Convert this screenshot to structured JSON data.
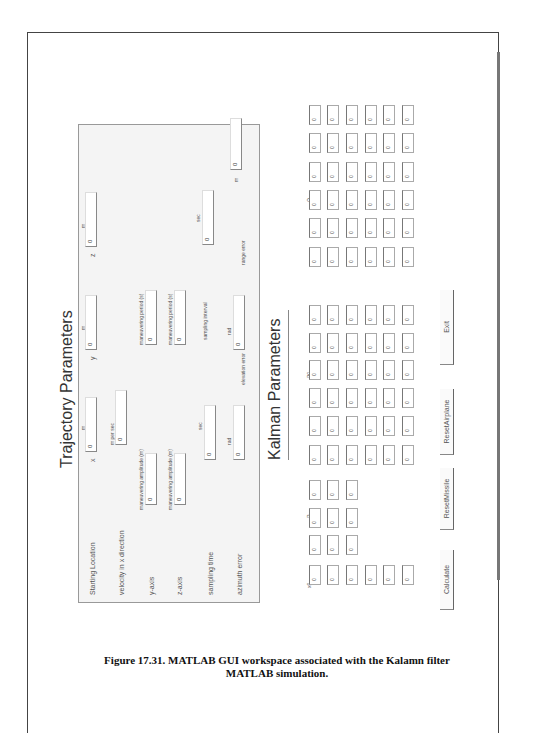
{
  "caption": {
    "line1": "Figure 17.31. MATLAB GUI workspace associated with the Kalamn filter",
    "line2": "MATLAB simulation."
  },
  "trajectory": {
    "title": "Trajectory Parameters",
    "rows": [
      {
        "label": "Starting Location",
        "fields": [
          {
            "axis": "x",
            "unit": "m",
            "value": "0"
          },
          {
            "axis": "y",
            "unit": "m",
            "value": "0"
          },
          {
            "axis": "z",
            "unit": "m",
            "value": "0"
          }
        ]
      },
      {
        "label": "velocity in x direction",
        "unit": "m per sec",
        "value": "0"
      },
      {
        "label": "y-axis",
        "amplitude_label": "maneuvering amplitude (m)",
        "amplitude_value": "0",
        "period_label": "maneuvering period (s)",
        "period_value": "0"
      },
      {
        "label": "z-axis",
        "amplitude_label": "maneuvering amplitude (m)",
        "amplitude_value": "0",
        "period_label": "maneuvering period (s)",
        "period_value": "0"
      },
      {
        "label": "sampling time",
        "unit": "sec",
        "value": "0",
        "interval_label": "sampling interval",
        "interval_unit": "sec",
        "interval_value": "0"
      },
      {
        "label": "azimuth error",
        "unit": "rad",
        "value": "0",
        "elev_label": "elevation error",
        "elev_unit": "rad",
        "elev_value": "0",
        "range_label": "range error",
        "range_unit": "m",
        "range_value": "0"
      }
    ]
  },
  "kalman": {
    "title": "Kalman Parameters",
    "x0_label": "x0",
    "R_label": "R",
    "P0_label": "P0",
    "Q_label": "Q",
    "cell_value": "0",
    "x0_size": [
      6,
      1
    ],
    "R_size": [
      3,
      3
    ],
    "P0_size": [
      6,
      6
    ],
    "Q_size": [
      6,
      6
    ]
  },
  "buttons": {
    "calculate": "Calculate",
    "reset_missile": "ResetMissile",
    "reset_airplane": "ResetAirplane",
    "exit": "Exit"
  }
}
